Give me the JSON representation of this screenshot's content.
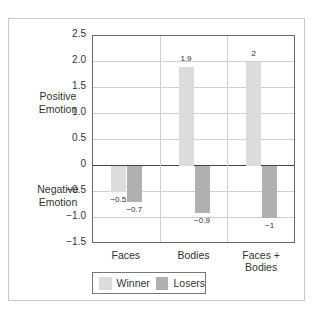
{
  "chart_data": {
    "type": "bar",
    "title": "",
    "xlabel": "",
    "ylabel_positive": "Positive Emotion",
    "ylabel_negative": "Negative Emotion",
    "categories": [
      "Faces",
      "Bodies",
      "Faces + Bodies"
    ],
    "series": [
      {
        "name": "Winner",
        "values": [
          -0.5,
          1.9,
          2
        ],
        "color": "#dcdcdc"
      },
      {
        "name": "Losers",
        "values": [
          -0.7,
          -0.9,
          -1
        ],
        "color": "#b0b0b0"
      }
    ],
    "data_labels": {
      "Winner": [
        "−0.5",
        "1.9",
        "2"
      ],
      "Losers": [
        "−0.7",
        "−0.9",
        "−1"
      ]
    },
    "ylim": [
      -1.5,
      2.5
    ],
    "yticks": [
      "2.5",
      "2.0",
      "1.5",
      "1.0",
      "0.5",
      "0",
      "−0.5",
      "−1.0",
      "−1.5"
    ],
    "grid": true,
    "legend_position": "bottom-left"
  },
  "labels": {
    "positive_line1": "Positive",
    "positive_line2": "Emotion",
    "negative_line1": "Negative",
    "negative_line2": "Emotion"
  },
  "legend": {
    "winner": "Winner",
    "losers": "Losers"
  }
}
